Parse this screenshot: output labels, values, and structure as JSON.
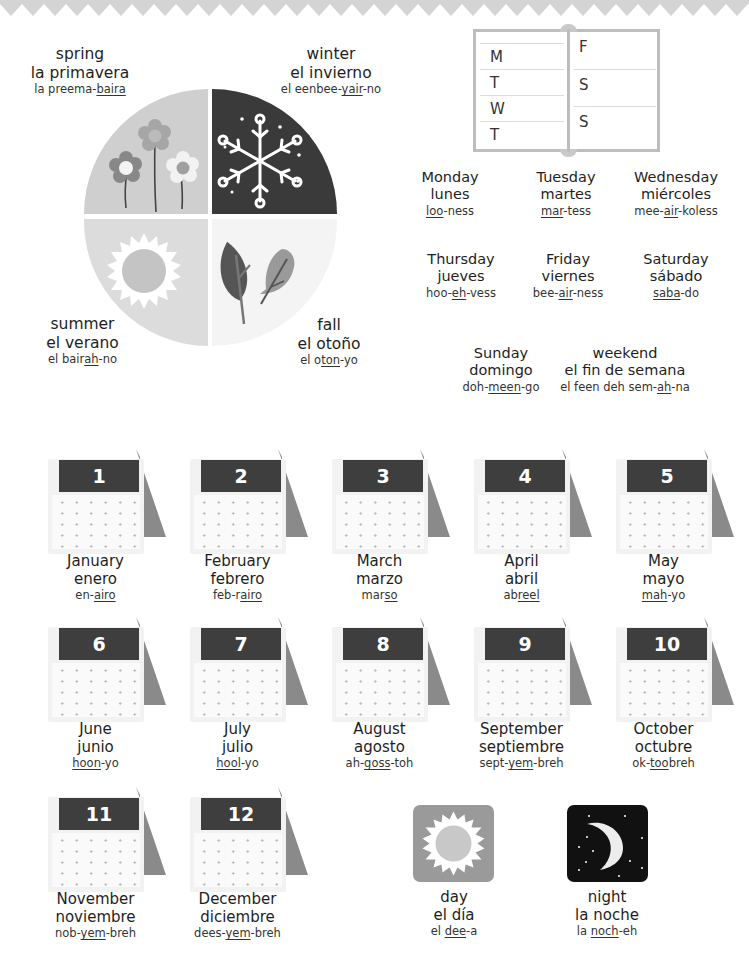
{
  "seasons": [
    {
      "key": "spring",
      "en": "spring",
      "es": "la primavera",
      "pron_pre": "la preema-",
      "pron_u": "baira",
      "pron_post": ""
    },
    {
      "key": "winter",
      "en": "winter",
      "es": "el invierno",
      "pron_pre": "el eenbee-",
      "pron_u": "yair",
      "pron_post": "-no"
    },
    {
      "key": "summer",
      "en": "summer",
      "es": "el verano",
      "pron_pre": "el bair",
      "pron_u": "ah",
      "pron_post": "-no"
    },
    {
      "key": "fall",
      "en": "fall",
      "es": "el otoño",
      "pron_pre": "el o",
      "pron_u": "ton",
      "pron_post": "-yo"
    }
  ],
  "week_book": {
    "left": [
      "M",
      "T",
      "W",
      "T"
    ],
    "right": [
      "F",
      "S",
      "S"
    ]
  },
  "days": [
    {
      "en": "Monday",
      "es": "lunes",
      "pron_pre": "",
      "pron_u": "loo",
      "pron_post": "-ness"
    },
    {
      "en": "Tuesday",
      "es": "martes",
      "pron_pre": "",
      "pron_u": "mar",
      "pron_post": "-tess"
    },
    {
      "en": "Wednesday",
      "es": "miércoles",
      "pron_pre": "mee-",
      "pron_u": "air",
      "pron_post": "-koless"
    },
    {
      "en": "Thursday",
      "es": "jueves",
      "pron_pre": "hoo-",
      "pron_u": "eh",
      "pron_post": "-vess"
    },
    {
      "en": "Friday",
      "es": "viernes",
      "pron_pre": "bee-",
      "pron_u": "air",
      "pron_post": "-ness"
    },
    {
      "en": "Saturday",
      "es": "sábado",
      "pron_pre": "",
      "pron_u": "saba",
      "pron_post": "-do"
    },
    {
      "en": "Sunday",
      "es": "domingo",
      "pron_pre": "doh-",
      "pron_u": "meen",
      "pron_post": "-go"
    },
    {
      "en": "weekend",
      "es": "el fin de semana",
      "pron_pre": "el feen deh sem-",
      "pron_u": "ah",
      "pron_post": "-na"
    }
  ],
  "months": [
    {
      "num": "1",
      "en": "January",
      "es": "enero",
      "pron_pre": "en-",
      "pron_u": "airo",
      "pron_post": ""
    },
    {
      "num": "2",
      "en": "February",
      "es": "febrero",
      "pron_pre": "feb-r",
      "pron_u": "airo",
      "pron_post": ""
    },
    {
      "num": "3",
      "en": "March",
      "es": "marzo",
      "pron_pre": "mar",
      "pron_u": "so",
      "pron_post": ""
    },
    {
      "num": "4",
      "en": "April",
      "es": "abril",
      "pron_pre": "ab",
      "pron_u": "reel",
      "pron_post": ""
    },
    {
      "num": "5",
      "en": "May",
      "es": "mayo",
      "pron_pre": "",
      "pron_u": "mah",
      "pron_post": "-yo"
    },
    {
      "num": "6",
      "en": "June",
      "es": "junio",
      "pron_pre": "",
      "pron_u": "hoon",
      "pron_post": "-yo"
    },
    {
      "num": "7",
      "en": "July",
      "es": "julio",
      "pron_pre": "",
      "pron_u": "hool",
      "pron_post": "-yo"
    },
    {
      "num": "8",
      "en": "August",
      "es": "agosto",
      "pron_pre": "ah-",
      "pron_u": "goss",
      "pron_post": "-toh"
    },
    {
      "num": "9",
      "en": "September",
      "es": "septiembre",
      "pron_pre": "sept-",
      "pron_u": "yem",
      "pron_post": "-breh"
    },
    {
      "num": "10",
      "en": "October",
      "es": "octubre",
      "pron_pre": "ok-",
      "pron_u": "too",
      "pron_post": "breh"
    },
    {
      "num": "11",
      "en": "November",
      "es": "noviembre",
      "pron_pre": "nob-",
      "pron_u": "yem",
      "pron_post": "-breh"
    },
    {
      "num": "12",
      "en": "December",
      "es": "diciembre",
      "pron_pre": "dees-",
      "pron_u": "yem",
      "pron_post": "-breh"
    }
  ],
  "time_of_day": [
    {
      "key": "day",
      "en": "day",
      "es": "el día",
      "pron_pre": "el ",
      "pron_u": "dee",
      "pron_post": "-a"
    },
    {
      "key": "night",
      "en": "night",
      "es": "la noche",
      "pron_pre": "la ",
      "pron_u": "noch",
      "pron_post": "-eh"
    }
  ],
  "colors": {
    "zigzag": "#d4d4d4",
    "spring": "#cfcfcf",
    "winter": "#3a3a3a",
    "summer": "#dcdcdc",
    "fall": "#f4f4f4",
    "cal_header": "#3e3e3e",
    "cal_stand": "#8a8a8a",
    "day_tile": "#9a9a9a",
    "night_tile": "#111111"
  }
}
